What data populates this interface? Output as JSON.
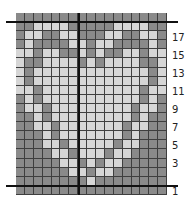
{
  "chart": {
    "columns": 17,
    "rows_count": 20,
    "colors": {
      "dark": "#8a8a8a",
      "light": "#d6d6d6",
      "gridline": "#3e3e3e",
      "marker_line": "#111111"
    },
    "rows": [
      "DDDDDDDDDDDDDDDDD",
      "DDLLLLDDDDDLLLLDD",
      "DLLDDLLDDDLLDDLLD",
      "DLDDDDLLDLLDDDDLD",
      "LLDLLDDLDLDDLLDLL",
      "LDDLLLLDLDLLLLDDL",
      "LDLLLLLLLLLLLLLDL",
      "LDLLLLLLLLLLLLLDL",
      "LLDLLLLLLLLLLLDLL",
      "DLDLLLLLLLLLLLDLD",
      "DLLDLLLLLLLLLDLLD",
      "DDLDLLLLLLLLLDLDD",
      "DDLLDLLLLLLLDLLDD",
      "DDDLDLLLLLLLDLDDD",
      "DDDLLDLLLLLDLLDDD",
      "DDDDLLDLLLDLLDDDD",
      "DDDDDLLDLDLLDDDDD",
      "DDDDDDLLDLLDDDDDD",
      "DDDDDDDDLDDDDDDDD",
      "DDDDDDDDDDDDDDDDD"
    ],
    "row_labels": [
      {
        "text": "17",
        "y": 33
      },
      {
        "text": "15",
        "y": 51
      },
      {
        "text": "13",
        "y": 69
      },
      {
        "text": "11",
        "y": 87
      },
      {
        "text": "9",
        "y": 105
      },
      {
        "text": "7",
        "y": 123
      },
      {
        "text": "5",
        "y": 141
      },
      {
        "text": "3",
        "y": 159
      },
      {
        "text": "1",
        "y": 187
      }
    ]
  }
}
